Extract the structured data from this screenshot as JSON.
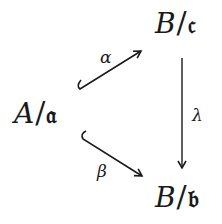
{
  "diagram": {
    "type": "commutative-triangle",
    "nodes": {
      "left": {
        "base": "A",
        "slash": "/",
        "ideal": "𝔞"
      },
      "top": {
        "base": "B",
        "slash": "/",
        "ideal": "𝔠"
      },
      "bottom": {
        "base": "B",
        "slash": "/",
        "ideal": "𝔟"
      }
    },
    "arrows": {
      "alpha": {
        "label": "α",
        "from": "A/𝔞",
        "to": "B/𝔠",
        "style": "hook-injection"
      },
      "beta": {
        "label": "β",
        "from": "A/𝔞",
        "to": "B/𝔟",
        "style": "hook-injection"
      },
      "lambda": {
        "label": "λ",
        "from": "B/𝔠",
        "to": "B/𝔟",
        "style": "plain"
      }
    },
    "colors": {
      "ink": "#1a1a1a",
      "background": "#ffffff"
    }
  }
}
